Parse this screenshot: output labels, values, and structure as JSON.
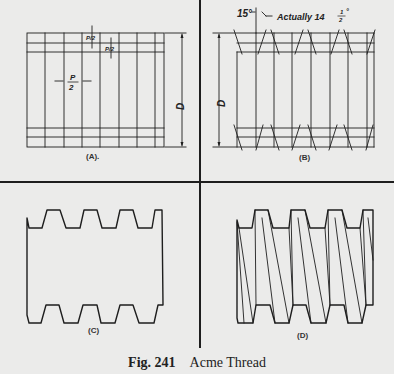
{
  "figure": {
    "number": "Fig. 241",
    "title": "Acme Thread"
  },
  "panels": [
    {
      "id": "A",
      "label": "(A).",
      "description": "Layout: pitch divisions P/2 and depth lines for Acme thread",
      "annotations": {
        "pitch_half": {
          "num": "P",
          "den": "2"
        },
        "depth": "P/2",
        "diameter": "D"
      }
    },
    {
      "id": "B",
      "label": "(B)",
      "description": "Flank lines drawn at 15° (actually 14½°)",
      "annotations": {
        "angle": "15°",
        "note_prefix": "Actually 14",
        "note_frac_num": "1",
        "note_frac_den": "2",
        "degree": "°",
        "diameter": "D"
      }
    },
    {
      "id": "C",
      "label": "(C)",
      "description": "Thread profile outline"
    },
    {
      "id": "D",
      "label": "(D)",
      "description": "Finished Acme thread with crest and root helix lines"
    }
  ],
  "colors": {
    "background": "#ebebea",
    "ink": "#1e1e1e"
  }
}
